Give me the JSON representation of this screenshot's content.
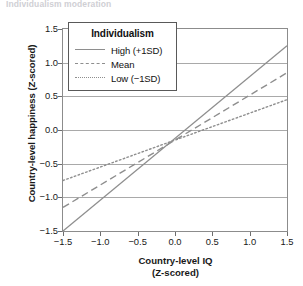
{
  "top_fragment": "Individualism moderation",
  "chart_data": {
    "type": "line",
    "title": "",
    "xlabel_line1": "Country-level IQ",
    "xlabel_line2": "(Z-scored)",
    "ylabel": "Country-level happiness (Z-scored)",
    "xlim": [
      -1.5,
      1.5
    ],
    "ylim": [
      -1.5,
      1.5
    ],
    "xticks": [
      "−1.5",
      "−1.0",
      "−0.5",
      "0.0",
      "0.5",
      "1.0",
      "1.5"
    ],
    "xtick_values": [
      -1.5,
      -1.0,
      -0.5,
      0.0,
      0.5,
      1.0,
      1.5
    ],
    "yticks": [
      "1.5",
      "1.0",
      "0.5",
      "0.0",
      "−0.5",
      "−1.0",
      "−1.5"
    ],
    "ytick_values": [
      1.5,
      1.0,
      0.5,
      0.0,
      -0.5,
      -1.0,
      -1.5
    ],
    "grid": "horizontal",
    "legend_position": "top-left-inside",
    "legend_title": "Individualism",
    "x": [
      -1.5,
      1.5
    ],
    "series": [
      {
        "name": "High (+1SD)",
        "style": "solid",
        "color": "#8e8e8e",
        "values": [
          -1.5,
          1.25
        ],
        "slope": 0.917,
        "intercept": -0.125
      },
      {
        "name": "Mean",
        "style": "dashed",
        "color": "#8e8e8e",
        "values": [
          -1.15,
          0.85
        ],
        "slope": 0.667,
        "intercept": -0.15
      },
      {
        "name": "Low (−1SD)",
        "style": "dotted",
        "color": "#8e8e8e",
        "values": [
          -0.75,
          0.45
        ],
        "slope": 0.4,
        "intercept": -0.15
      }
    ]
  },
  "colors": {
    "line": "#8e8e8e",
    "grid": "#a9a9a9",
    "frame": "#8c8c8c",
    "text": "#191919",
    "background": "#ffffff"
  }
}
